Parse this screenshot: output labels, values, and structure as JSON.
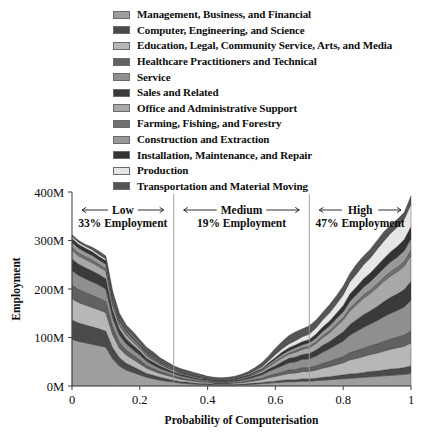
{
  "legend": {
    "items": [
      {
        "label": "Management, Business, and Financial",
        "color": "#9e9e9e"
      },
      {
        "label": "Computer, Engineering, and Science",
        "color": "#4a4a4a"
      },
      {
        "label": "Education, Legal, Community Service, Arts, and Media",
        "color": "#b7b7b7"
      },
      {
        "label": "Healthcare Practitioners and Technical",
        "color": "#616161"
      },
      {
        "label": "Service",
        "color": "#8f8f8f"
      },
      {
        "label": "Sales and Related",
        "color": "#3a3a3a"
      },
      {
        "label": "Office and Administrative Support",
        "color": "#a8a8a8"
      },
      {
        "label": "Farming, Fishing, and Forestry",
        "color": "#707070"
      },
      {
        "label": "Construction and Extraction",
        "color": "#999999"
      },
      {
        "label": "Installation, Maintenance, and Repair",
        "color": "#333333"
      },
      {
        "label": "Production",
        "color": "#e6e6e6"
      },
      {
        "label": "Transportation and Material Moving",
        "color": "#555555"
      }
    ]
  },
  "chart_data": {
    "type": "area",
    "title": "",
    "xlabel": "Probability of Computerisation",
    "ylabel": "Employment",
    "xlim": [
      0,
      1
    ],
    "ylim": [
      0,
      400
    ],
    "yunit": "M",
    "grid": false,
    "legend_position": "top",
    "xticks": [
      "0",
      "0.2",
      "0.4",
      "0.6",
      "0.8",
      "1"
    ],
    "xtick_values": [
      0,
      0.2,
      0.4,
      0.6,
      0.8,
      1
    ],
    "yticks": [
      "0M",
      "100M",
      "200M",
      "300M",
      "400M"
    ],
    "ytick_values": [
      0,
      100,
      200,
      300,
      400
    ],
    "stacked": true,
    "x": [
      0.0,
      0.02,
      0.04,
      0.06,
      0.08,
      0.1,
      0.12,
      0.14,
      0.16,
      0.18,
      0.2,
      0.22,
      0.24,
      0.26,
      0.28,
      0.3,
      0.32,
      0.34,
      0.36,
      0.38,
      0.4,
      0.42,
      0.44,
      0.46,
      0.48,
      0.5,
      0.52,
      0.54,
      0.56,
      0.58,
      0.6,
      0.62,
      0.64,
      0.66,
      0.68,
      0.7,
      0.72,
      0.74,
      0.76,
      0.78,
      0.8,
      0.82,
      0.84,
      0.86,
      0.88,
      0.9,
      0.92,
      0.94,
      0.96,
      0.98,
      1.0
    ],
    "total": [
      312,
      300,
      292,
      286,
      278,
      268,
      196,
      150,
      126,
      112,
      96,
      80,
      70,
      58,
      50,
      42,
      36,
      32,
      28,
      24,
      20,
      18,
      17,
      18,
      20,
      24,
      30,
      38,
      48,
      62,
      78,
      92,
      104,
      112,
      118,
      124,
      136,
      152,
      168,
      186,
      206,
      232,
      252,
      268,
      282,
      300,
      318,
      332,
      344,
      358,
      392
    ],
    "series": [
      {
        "name": "Management, Business, and Financial",
        "color": "#9e9e9e",
        "values": [
          96,
          92,
          89,
          86,
          83,
          80,
          56,
          41,
          33,
          28,
          23,
          18,
          15,
          12,
          10,
          8,
          6,
          5,
          4,
          3,
          3,
          2,
          2,
          2,
          2,
          3,
          3,
          4,
          5,
          6,
          7,
          8,
          9,
          9,
          10,
          10,
          11,
          12,
          13,
          14,
          15,
          16,
          17,
          18,
          19,
          20,
          21,
          22,
          23,
          24,
          26
        ]
      },
      {
        "name": "Computer, Engineering, and Science",
        "color": "#4a4a4a",
        "values": [
          40,
          38,
          37,
          36,
          35,
          33,
          23,
          17,
          14,
          12,
          10,
          8,
          7,
          6,
          5,
          4,
          3,
          3,
          2,
          2,
          2,
          1,
          1,
          1,
          1,
          1,
          2,
          2,
          2,
          3,
          3,
          4,
          4,
          4,
          5,
          5,
          5,
          6,
          6,
          7,
          8,
          9,
          9,
          10,
          11,
          11,
          12,
          13,
          13,
          14,
          15
        ]
      },
      {
        "name": "Education, Legal, Community Service, Arts, and Media",
        "color": "#b7b7b7",
        "values": [
          44,
          42,
          41,
          40,
          39,
          38,
          27,
          20,
          17,
          15,
          13,
          11,
          9,
          8,
          7,
          6,
          5,
          4,
          4,
          3,
          3,
          2,
          2,
          2,
          3,
          3,
          4,
          5,
          6,
          8,
          10,
          11,
          13,
          14,
          15,
          15,
          17,
          19,
          21,
          23,
          25,
          29,
          31,
          33,
          35,
          37,
          39,
          41,
          43,
          44,
          48
        ]
      },
      {
        "name": "Healthcare Practitioners and Technical",
        "color": "#616161",
        "values": [
          28,
          27,
          26,
          25,
          24,
          23,
          16,
          12,
          10,
          9,
          8,
          6,
          5,
          4,
          4,
          3,
          3,
          2,
          2,
          2,
          2,
          1,
          1,
          1,
          1,
          2,
          2,
          3,
          3,
          4,
          5,
          6,
          7,
          7,
          8,
          8,
          9,
          10,
          11,
          12,
          13,
          15,
          16,
          17,
          18,
          19,
          20,
          21,
          22,
          23,
          25
        ]
      },
      {
        "name": "Service",
        "color": "#8f8f8f",
        "values": [
          30,
          29,
          28,
          28,
          27,
          26,
          19,
          15,
          13,
          11,
          10,
          8,
          7,
          6,
          5,
          5,
          4,
          4,
          3,
          3,
          2,
          2,
          2,
          2,
          3,
          3,
          4,
          5,
          7,
          9,
          11,
          13,
          15,
          16,
          17,
          18,
          20,
          23,
          26,
          29,
          32,
          36,
          40,
          43,
          45,
          48,
          51,
          53,
          55,
          58,
          63
        ]
      },
      {
        "name": "Sales and Related",
        "color": "#3a3a3a",
        "values": [
          24,
          23,
          23,
          22,
          22,
          21,
          15,
          12,
          10,
          9,
          8,
          6,
          6,
          5,
          4,
          3,
          3,
          3,
          2,
          2,
          2,
          1,
          1,
          1,
          2,
          2,
          3,
          3,
          4,
          5,
          6,
          8,
          9,
          10,
          10,
          11,
          12,
          14,
          15,
          17,
          19,
          22,
          24,
          26,
          27,
          29,
          31,
          33,
          34,
          36,
          39
        ]
      },
      {
        "name": "Office and Administrative Support",
        "color": "#a8a8a8",
        "values": [
          18,
          17,
          17,
          17,
          16,
          16,
          11,
          9,
          8,
          7,
          6,
          5,
          4,
          4,
          3,
          3,
          2,
          2,
          2,
          2,
          1,
          1,
          1,
          1,
          1,
          2,
          2,
          3,
          4,
          5,
          7,
          8,
          9,
          10,
          11,
          12,
          14,
          16,
          18,
          21,
          24,
          28,
          31,
          34,
          36,
          39,
          42,
          44,
          46,
          48,
          53
        ]
      },
      {
        "name": "Farming, Fishing, and Forestry",
        "color": "#707070",
        "values": [
          6,
          6,
          6,
          6,
          5,
          5,
          4,
          3,
          3,
          2,
          2,
          2,
          2,
          1,
          1,
          1,
          1,
          1,
          1,
          1,
          1,
          1,
          1,
          1,
          1,
          1,
          1,
          1,
          1,
          2,
          2,
          2,
          2,
          3,
          3,
          3,
          3,
          4,
          4,
          5,
          5,
          6,
          6,
          7,
          7,
          8,
          8,
          9,
          9,
          10,
          11
        ]
      },
      {
        "name": "Construction and Extraction",
        "color": "#999999",
        "values": [
          10,
          10,
          9,
          9,
          9,
          9,
          6,
          5,
          4,
          4,
          3,
          3,
          2,
          2,
          2,
          2,
          1,
          1,
          1,
          1,
          1,
          1,
          1,
          1,
          1,
          1,
          1,
          2,
          2,
          3,
          4,
          5,
          5,
          6,
          6,
          7,
          8,
          9,
          10,
          11,
          12,
          14,
          15,
          16,
          17,
          18,
          19,
          20,
          21,
          22,
          24
        ]
      },
      {
        "name": "Installation, Maintenance, and Repair",
        "color": "#333333",
        "values": [
          8,
          8,
          8,
          8,
          7,
          7,
          5,
          4,
          4,
          3,
          3,
          2,
          2,
          2,
          2,
          1,
          1,
          1,
          1,
          1,
          1,
          1,
          1,
          1,
          1,
          1,
          1,
          2,
          2,
          3,
          4,
          5,
          6,
          6,
          7,
          7,
          8,
          9,
          10,
          11,
          13,
          15,
          16,
          17,
          18,
          19,
          20,
          21,
          22,
          23,
          25
        ]
      },
      {
        "name": "Production",
        "color": "#e6e6e6",
        "values": [
          4,
          4,
          4,
          4,
          4,
          4,
          3,
          2,
          2,
          2,
          2,
          1,
          1,
          1,
          1,
          1,
          1,
          1,
          1,
          1,
          1,
          1,
          1,
          1,
          1,
          1,
          2,
          2,
          3,
          4,
          6,
          7,
          8,
          9,
          10,
          11,
          13,
          15,
          17,
          19,
          22,
          25,
          27,
          29,
          31,
          34,
          36,
          38,
          40,
          42,
          46
        ]
      },
      {
        "name": "Transportation and Material Moving",
        "color": "#555555",
        "values": [
          4,
          4,
          4,
          5,
          7,
          6,
          11,
          10,
          8,
          10,
          8,
          10,
          10,
          7,
          6,
          5,
          6,
          5,
          5,
          3,
          1,
          4,
          3,
          4,
          3,
          4,
          5,
          6,
          9,
          10,
          13,
          15,
          17,
          18,
          16,
          17,
          16,
          15,
          17,
          17,
          18,
          17,
          20,
          18,
          18,
          18,
          19,
          17,
          16,
          14,
          17
        ]
      }
    ],
    "annotations": [
      {
        "name": "low",
        "label": "Low",
        "sub": "33% Employment",
        "x_start": 0.0,
        "x_end": 0.3
      },
      {
        "name": "medium",
        "label": "Medium",
        "sub": "19% Employment",
        "x_start": 0.3,
        "x_end": 0.7
      },
      {
        "name": "high",
        "label": "High",
        "sub": "47% Employment",
        "x_start": 0.7,
        "x_end": 1.0
      }
    ],
    "dividers": [
      0.3,
      0.7
    ]
  }
}
